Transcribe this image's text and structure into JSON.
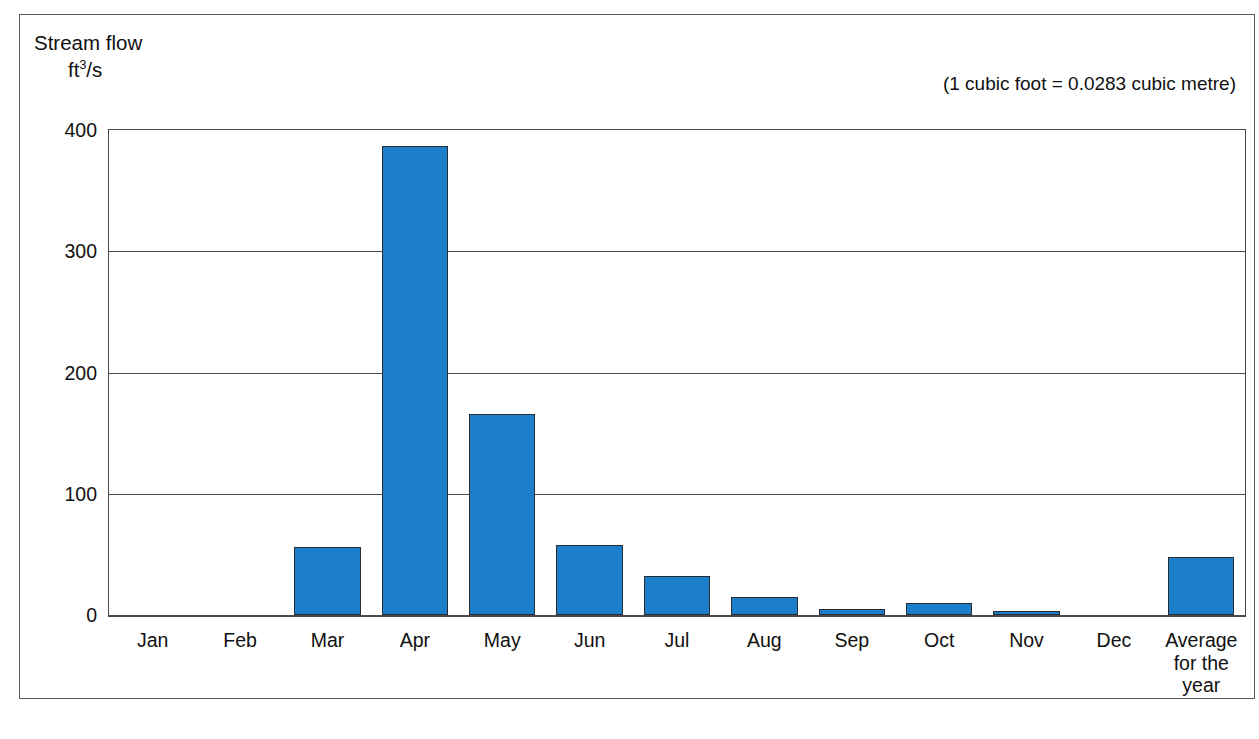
{
  "chart_data": {
    "type": "bar",
    "title": "",
    "ylabel_line1": "Stream flow",
    "ylabel_unit_base": "ft",
    "ylabel_unit_sup": "3",
    "ylabel_unit_tail": "/s",
    "xlabel": "",
    "ylim": [
      0,
      400
    ],
    "yticks": [
      400,
      300,
      200,
      100,
      0
    ],
    "ytick_labels": [
      "400",
      "300",
      "200",
      "100",
      "0"
    ],
    "grid": true,
    "legend": "none",
    "annotation": "(1 cubic foot = 0.0283 cubic metre)",
    "bar_color": "#1c7fcc",
    "bar_edge_color": "#2b2b30",
    "categories": [
      "Jan",
      "Feb",
      "Mar",
      "Apr",
      "May",
      "Jun",
      "Jul",
      "Aug",
      "Sep",
      "Oct",
      "Nov",
      "Dec",
      "Average\nfor the\nyear"
    ],
    "values": [
      0,
      0,
      56,
      387,
      166,
      58,
      32,
      15,
      5,
      10,
      3,
      0,
      48
    ]
  },
  "caption": {
    "text": ""
  }
}
